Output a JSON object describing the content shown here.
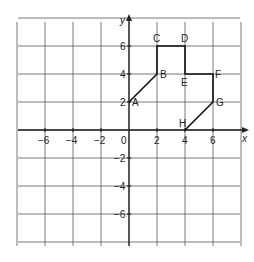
{
  "axes": {
    "x_label": "x",
    "y_label": "y",
    "x_ticks": [
      {
        "value": -6,
        "label": "−6"
      },
      {
        "value": -4,
        "label": "−4"
      },
      {
        "value": -2,
        "label": "−2"
      },
      {
        "value": 2,
        "label": "2"
      },
      {
        "value": 4,
        "label": "4"
      },
      {
        "value": 6,
        "label": "6"
      }
    ],
    "y_ticks": [
      {
        "value": 6,
        "label": "6"
      },
      {
        "value": 4,
        "label": "4"
      },
      {
        "value": 2,
        "label": "2"
      },
      {
        "value": -2,
        "label": "−2"
      },
      {
        "value": -4,
        "label": "−4"
      },
      {
        "value": -6,
        "label": "−6"
      }
    ],
    "origin_label": "0",
    "range": {
      "xmin": -8,
      "xmax": 8,
      "ymin": -8,
      "ymax": 8
    }
  },
  "points": [
    {
      "name": "A",
      "x": 0,
      "y": 2
    },
    {
      "name": "B",
      "x": 2,
      "y": 4
    },
    {
      "name": "C",
      "x": 2,
      "y": 6
    },
    {
      "name": "D",
      "x": 4,
      "y": 6
    },
    {
      "name": "E",
      "x": 4,
      "y": 4
    },
    {
      "name": "F",
      "x": 6,
      "y": 4
    },
    {
      "name": "G",
      "x": 6,
      "y": 2
    },
    {
      "name": "H",
      "x": 4,
      "y": 0
    }
  ]
}
